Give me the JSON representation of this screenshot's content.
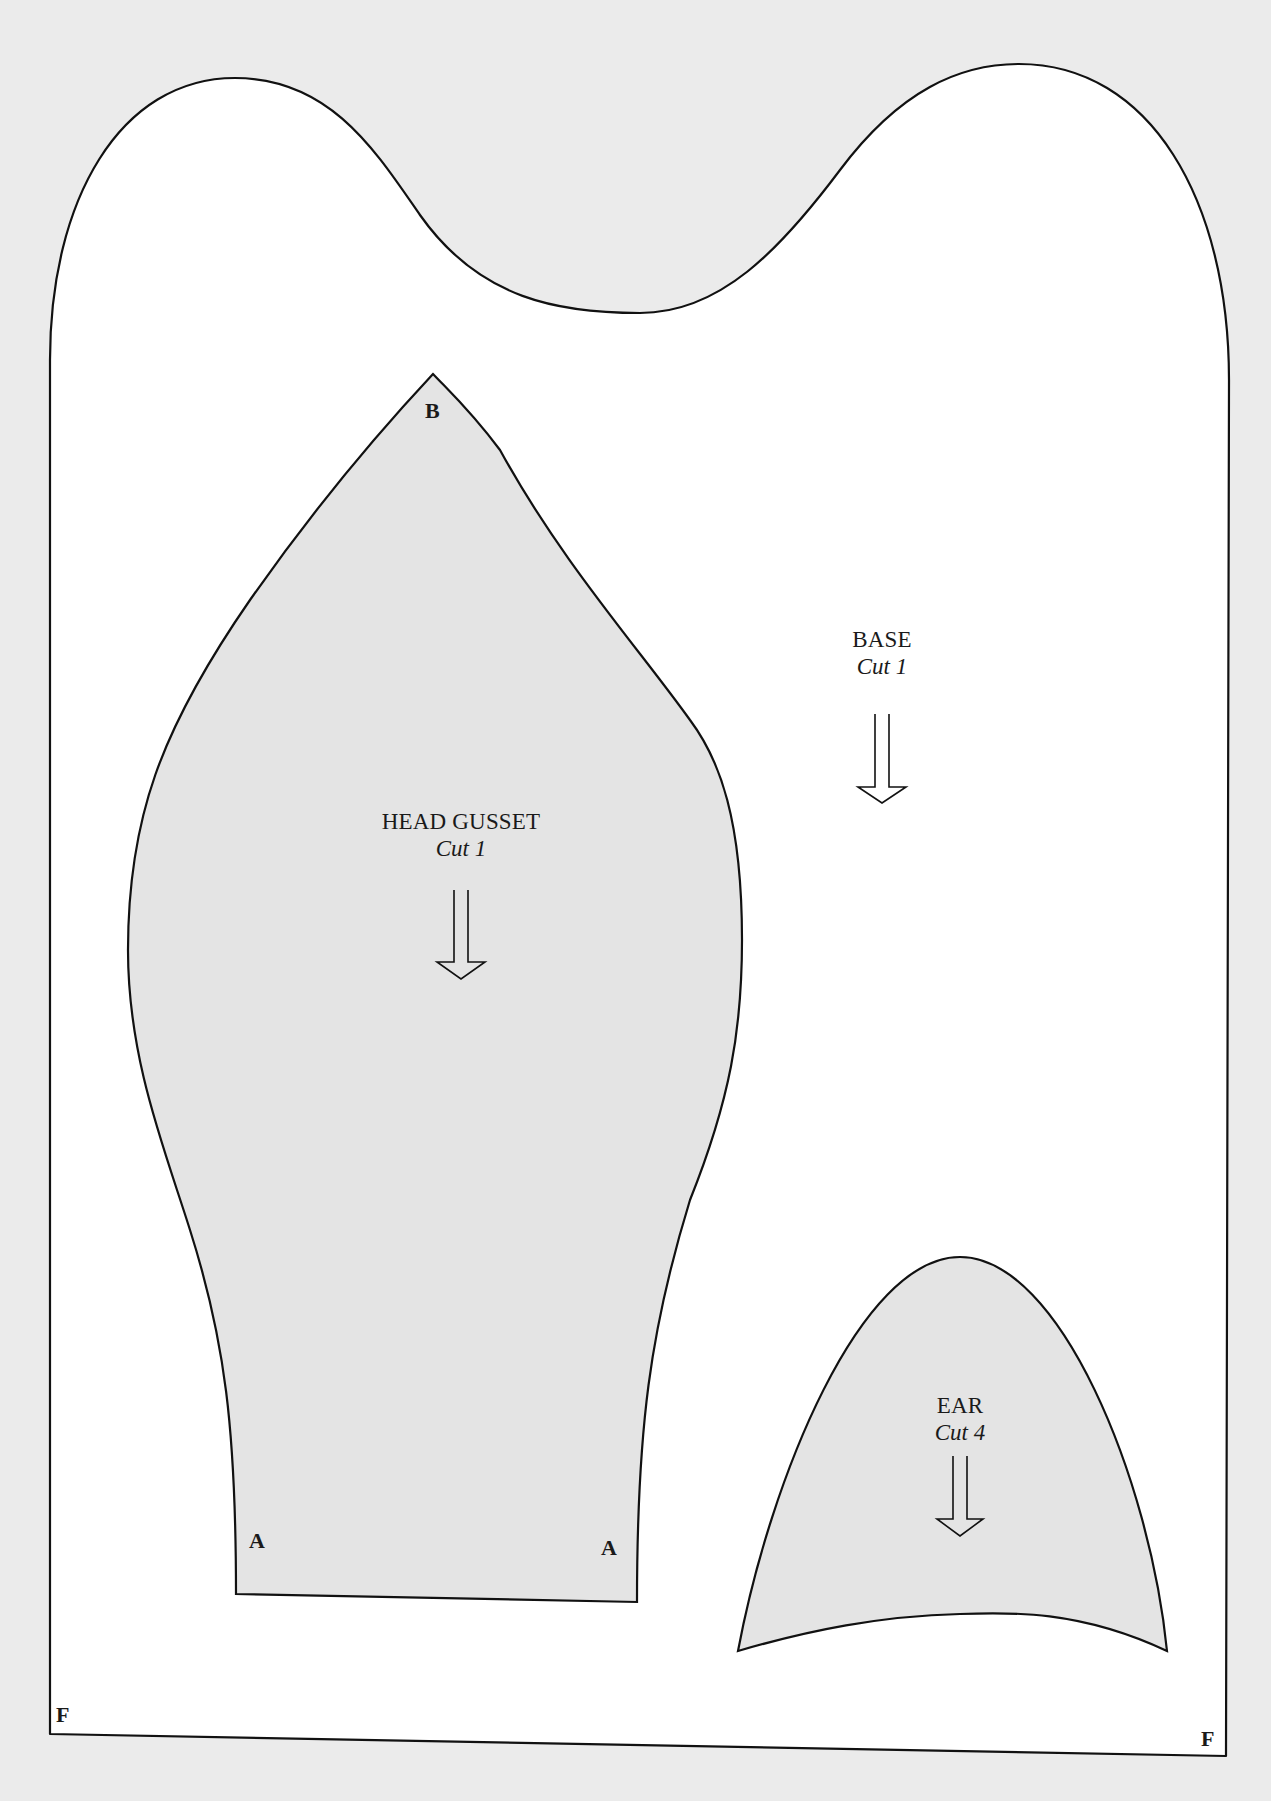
{
  "colors": {
    "background": "#ebebeb",
    "base_fill": "#ffffff",
    "piece_fill": "#e4e4e4",
    "outline": "#111111"
  },
  "pieces": {
    "base": {
      "title": "BASE",
      "cut": "Cut 1"
    },
    "head_gusset": {
      "title": "HEAD GUSSET",
      "cut": "Cut 1"
    },
    "ear": {
      "title": "EAR",
      "cut": "Cut 4"
    }
  },
  "markers": {
    "gusset_top": "B",
    "gusset_bottom_left": "A",
    "gusset_bottom_right": "A",
    "base_bottom_left": "F",
    "base_bottom_right": "F"
  }
}
